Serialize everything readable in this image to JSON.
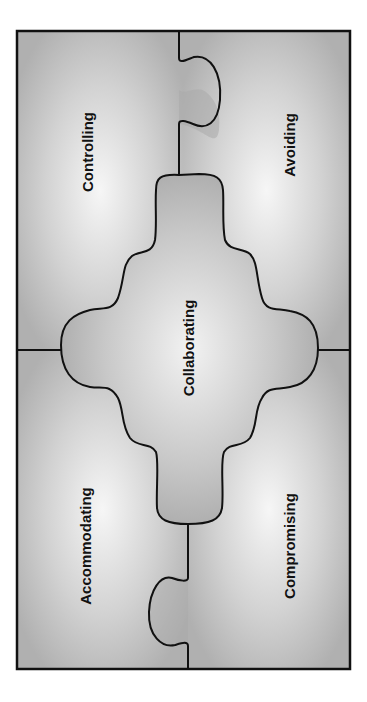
{
  "diagram": {
    "type": "puzzle",
    "pieces": {
      "top_left": {
        "label": "Controlling"
      },
      "top_right": {
        "label": "Avoiding"
      },
      "bottom_left": {
        "label": "Accommodating"
      },
      "bottom_right": {
        "label": "Compromising"
      },
      "center": {
        "label": "Collaborating"
      }
    },
    "colors": {
      "background": "#ffffff",
      "panel_base": "#b8b8b8",
      "panel_highlight": "#f4f4f4",
      "outline": "#111111",
      "text": "#111111"
    }
  }
}
